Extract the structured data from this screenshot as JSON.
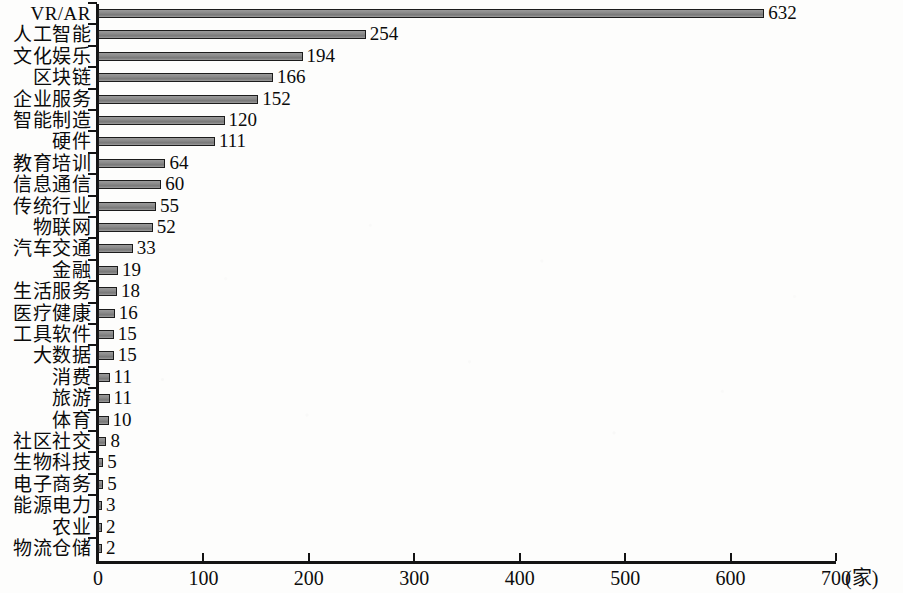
{
  "chart_data": {
    "type": "bar",
    "orientation": "horizontal",
    "title": "",
    "xlabel": "(家)",
    "ylabel": "",
    "xlim": [
      0,
      700
    ],
    "grid": false,
    "legend": null,
    "x_unit": "(家)",
    "x_ticks": [
      0,
      100,
      200,
      300,
      400,
      500,
      600,
      700
    ],
    "x_tick_labels": [
      "0",
      "100",
      "200",
      "300",
      "400",
      "500",
      "600",
      "700"
    ],
    "categories": [
      "VR/AR",
      "人工智能",
      "文化娱乐",
      "区块链",
      "企业服务",
      "智能制造",
      "硬件",
      "教育培训",
      "信息通信",
      "传统行业",
      "物联网",
      "汽车交通",
      "金融",
      "生活服务",
      "医疗健康",
      "工具软件",
      "大数据",
      "消费",
      "旅游",
      "体育",
      "社区社交",
      "生物科技",
      "电子商务",
      "能源电力",
      "农业",
      "物流仓储"
    ],
    "values": [
      632,
      254,
      194,
      166,
      152,
      120,
      111,
      64,
      60,
      55,
      52,
      33,
      19,
      18,
      16,
      15,
      15,
      11,
      11,
      10,
      8,
      5,
      5,
      3,
      2,
      2
    ],
    "value_labels": [
      "632",
      "254",
      "194",
      "166",
      "152",
      "120",
      "111",
      "64",
      "60",
      "55",
      "52",
      "33",
      "19",
      "18",
      "16",
      "15",
      "15",
      "11",
      "11",
      "10",
      "8",
      "5",
      "5",
      "3",
      "2",
      "2"
    ],
    "colors": {
      "bar_fill": "#8e8e8e",
      "bar_border": "#1c1c1c",
      "axis": "#141414",
      "text": "#0b0b0b",
      "background": "#fdfdfc"
    }
  }
}
